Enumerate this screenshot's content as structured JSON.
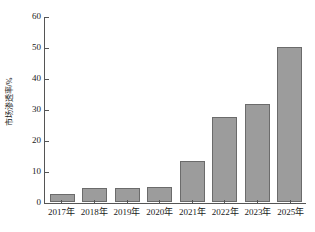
{
  "chart_data": {
    "type": "bar",
    "title": "",
    "xlabel": "",
    "ylabel": "市场渗透率/%",
    "categories": [
      "2017年",
      "2018年",
      "2019年",
      "2020年",
      "2021年",
      "2022年",
      "2023年",
      "2025年"
    ],
    "values": [
      2.5,
      4.5,
      4.5,
      5.0,
      13.2,
      27.5,
      31.5,
      50.0
    ],
    "ylim": [
      0,
      60
    ],
    "yticks": [
      0,
      10,
      20,
      30,
      40,
      50,
      60
    ],
    "ytick_labels": [
      "0",
      "10",
      "20",
      "30",
      "40",
      "50",
      "60"
    ],
    "grid": false,
    "legend": "none",
    "bar_color": "#9c9c9c",
    "bar_edge_color": "#6b6b6b",
    "axis_color": "#555555"
  }
}
